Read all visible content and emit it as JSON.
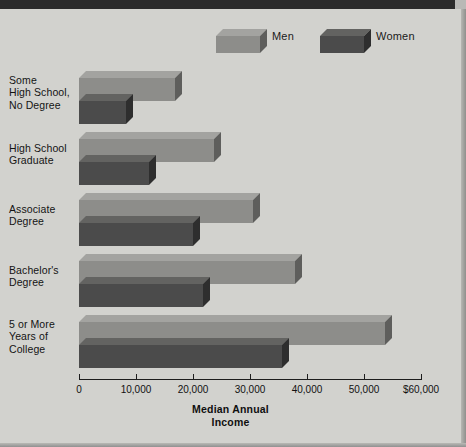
{
  "figure": {
    "background_color": "#d2d2ce",
    "border_color": "#2b2b2b"
  },
  "legend": {
    "position": "top-center",
    "items": [
      {
        "label": "Men",
        "color": "#8d8d8a",
        "top_color": "#a3a3a0",
        "side_color": "#5e5e5c"
      },
      {
        "label": "Women",
        "color": "#4b4b4b",
        "top_color": "#636361",
        "side_color": "#2e2e2e"
      }
    ]
  },
  "axis": {
    "title_line1": "Median Annual",
    "title_line2": "Income",
    "ticks": [
      "0",
      "10,000",
      "20,000",
      "30,000",
      "40,000",
      "50,000",
      "$60,000"
    ],
    "tick_values": [
      0,
      10000,
      20000,
      30000,
      40000,
      50000,
      60000
    ],
    "min": 0,
    "max": 60000
  },
  "categories": [
    {
      "lines": [
        "Some",
        "High School,",
        "No Degree"
      ]
    },
    {
      "lines": [
        "High School",
        "Graduate"
      ]
    },
    {
      "lines": [
        "Associate",
        "Degree"
      ]
    },
    {
      "lines": [
        "Bachelor's",
        "Degree"
      ]
    },
    {
      "lines": [
        "5 or More",
        "Years of",
        "College"
      ]
    }
  ],
  "chart_data": {
    "type": "bar",
    "orientation": "horizontal",
    "title": "",
    "xlabel": "Median Annual Income",
    "ylabel": "",
    "xlim": [
      0,
      60000
    ],
    "grid": false,
    "legend_position": "top",
    "categories": [
      "Some High School, No Degree",
      "High School Graduate",
      "Associate Degree",
      "Bachelor's Degree",
      "5 or More Years of College"
    ],
    "series": [
      {
        "name": "Men",
        "color": "#8d8d8a",
        "values": [
          16800,
          23700,
          30500,
          37900,
          53700
        ]
      },
      {
        "name": "Women",
        "color": "#4b4b4b",
        "values": [
          8200,
          12300,
          20000,
          21800,
          35600
        ]
      }
    ],
    "xticks": [
      0,
      10000,
      20000,
      30000,
      40000,
      50000,
      60000
    ],
    "xticklabels": [
      "0",
      "10,000",
      "20,000",
      "30,000",
      "40,000",
      "50,000",
      "$60,000"
    ]
  }
}
